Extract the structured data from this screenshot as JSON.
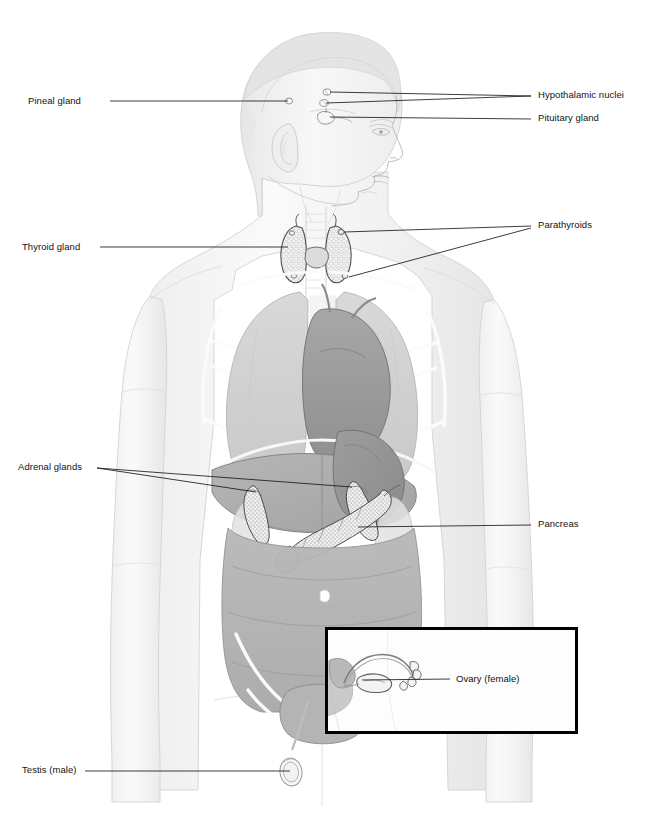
{
  "figure": {
    "view": "anterior whole-body ghost view with right-facing profile head",
    "background_color": "#ffffff",
    "line_color": "#1a1a1a",
    "body_tint": "#f2f2f2",
    "organ_tint_light": "#d8d8d8",
    "organ_tint_mid": "#bcbcbc",
    "organ_tint_dark": "#9c9c9c",
    "gland_fill": "#f4f4f4"
  },
  "labels": {
    "pineal_gland": "Pineal gland",
    "hypothalamic_nuclei": "Hypothalamic nuclei",
    "pituitary_gland": "Pituitary gland",
    "thyroid_gland": "Thyroid gland",
    "parathyroids": "Parathyroids",
    "adrenal_glands": "Adrenal glands",
    "pancreas": "Pancreas",
    "ovary_female": "Ovary (female)",
    "testis_male": "Testis (male)"
  },
  "inset": {
    "name": "ovary-inset-box",
    "border_color": "#000000",
    "border_width": 3,
    "x": 325,
    "y": 627,
    "width": 253,
    "height": 107
  },
  "callouts": [
    {
      "name": "pineal-gland",
      "label": "Pineal gland",
      "side": "left",
      "text_x": 28,
      "text_y": 95,
      "leaders": [
        [
          110,
          101,
          288,
          101
        ]
      ]
    },
    {
      "name": "hypothalamic-nuclei",
      "label": "Hypothalamic nuclei",
      "side": "right",
      "text_x": 538,
      "text_y": 90,
      "leaders": [
        [
          531,
          96,
          330,
          92
        ],
        [
          531,
          96,
          326,
          103
        ]
      ]
    },
    {
      "name": "pituitary-gland",
      "label": "Pituitary gland",
      "side": "right",
      "text_x": 538,
      "text_y": 113,
      "leaders": [
        [
          531,
          119,
          326,
          117
        ]
      ]
    },
    {
      "name": "thyroid-gland",
      "label": "Thyroid gland",
      "side": "left",
      "text_x": 22,
      "text_y": 241,
      "leaders": [
        [
          100,
          247,
          288,
          247
        ]
      ]
    },
    {
      "name": "parathyroids",
      "label": "Parathyroids",
      "side": "right",
      "text_x": 538,
      "text_y": 220,
      "leaders": [
        [
          531,
          226,
          342,
          232
        ],
        [
          531,
          228,
          347,
          277
        ]
      ]
    },
    {
      "name": "adrenal-glands",
      "label": "Adrenal glands",
      "side": "left",
      "text_x": 18,
      "text_y": 461,
      "leaders": [
        [
          97,
          468,
          258,
          492
        ],
        [
          97,
          468,
          350,
          487
        ]
      ]
    },
    {
      "name": "pancreas",
      "label": "Pancreas",
      "side": "right",
      "text_x": 538,
      "text_y": 519,
      "leaders": [
        [
          531,
          525,
          356,
          527
        ]
      ]
    },
    {
      "name": "ovary-female",
      "label": "Ovary (female)",
      "side": "right",
      "text_x": 455,
      "text_y": 673,
      "leaders": [
        [
          450,
          679,
          362,
          680
        ]
      ]
    },
    {
      "name": "testis-male",
      "label": "Testis (male)",
      "side": "left",
      "text_x": 22,
      "text_y": 764,
      "leaders": [
        [
          85,
          771,
          290,
          771
        ]
      ]
    }
  ],
  "organs_depicted": [
    "brain profile",
    "pineal gland",
    "hypothalamus",
    "pituitary gland",
    "thyroid gland",
    "parathyroid glands",
    "trachea",
    "lungs",
    "heart",
    "liver",
    "stomach",
    "adrenal glands",
    "kidneys",
    "pancreas",
    "small intestine",
    "large intestine",
    "bladder",
    "uterus",
    "fallopian tube",
    "ovary",
    "testis",
    "rib cage",
    "clavicle",
    "pelvis"
  ]
}
